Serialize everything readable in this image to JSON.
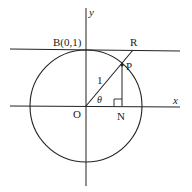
{
  "diagram": {
    "type": "unit-circle-geometry",
    "labels": {
      "y_axis": "y",
      "x_axis": "x",
      "point_B": "B(0,1)",
      "point_R": "R",
      "point_P": "P",
      "point_O": "O",
      "point_N": "N",
      "radius_label": "1",
      "angle_label": "θ"
    },
    "colors": {
      "stroke": "#222222",
      "background": "#ffffff"
    }
  }
}
